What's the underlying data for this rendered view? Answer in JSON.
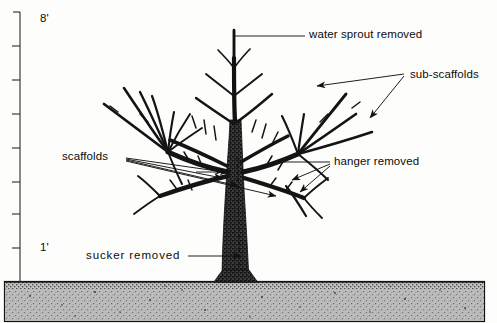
{
  "figure": {
    "kind": "pruning-diagram",
    "background_color": "#fdfdfc",
    "ink_color": "#101010",
    "soil_color": "#b9b9b9"
  },
  "scale": {
    "name": "vertical-height-scale",
    "unit": "feet",
    "top_label": "8'",
    "bottom_label": "1'",
    "tick_count": 8,
    "tick_values": [
      "8",
      "7",
      "6",
      "5",
      "4",
      "3",
      "2",
      "1"
    ]
  },
  "labels": {
    "water_sprout": "water sprout removed",
    "sub_scaffolds": "sub-scaffolds",
    "scaffolds": "scaffolds",
    "hanger": "hanger removed",
    "sucker": "sucker removed"
  },
  "ground": {
    "label": "soil",
    "surface_y_px": 281
  }
}
